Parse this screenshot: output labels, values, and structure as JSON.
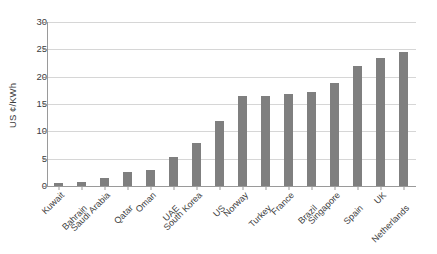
{
  "chart_data": {
    "type": "bar",
    "title": "",
    "subtitle": "",
    "xlabel": "",
    "ylabel": "US ¢/KWh",
    "ylim": [
      0,
      30
    ],
    "y_ticks": [
      0,
      5,
      10,
      15,
      20,
      25,
      30
    ],
    "grid": true,
    "legend": false,
    "legend_position": "none",
    "bar_color": "#7f7f7f",
    "axis_color": "#9a9a9a",
    "gridline_color": "#d6d6d6",
    "categories": [
      "Kuwait",
      "Bahrain",
      "Saudi Arabia",
      "Qatar",
      "Oman",
      "UAE",
      "South Korea",
      "US",
      "Norway",
      "Turkey",
      "France",
      "Brazil",
      "Singapore",
      "Spain",
      "UK",
      "Netherlands"
    ],
    "values": [
      0.5,
      0.8,
      1.4,
      2.5,
      2.9,
      5.3,
      7.9,
      11.9,
      16.4,
      16.4,
      16.9,
      17.2,
      18.8,
      22.0,
      23.5,
      24.5
    ]
  }
}
